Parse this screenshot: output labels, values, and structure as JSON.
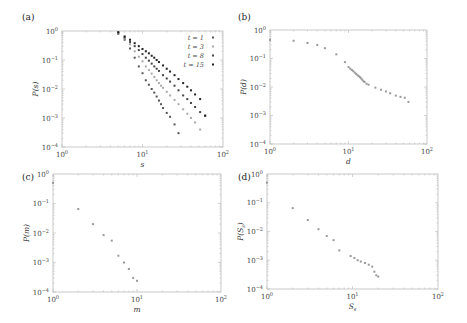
{
  "chart_data": [
    {
      "panel": "(a)",
      "type": "scatter",
      "xlabel": "s",
      "ylabel": "P(s)",
      "xscale": "log",
      "yscale": "log",
      "xlim": [
        1,
        100
      ],
      "ylim": [
        0.0001,
        1
      ],
      "xticks": [
        "10^0",
        "10^1",
        "10^2"
      ],
      "yticks": [
        "10^0",
        "10^-1",
        "10^-2",
        "10^-3",
        "10^-4"
      ],
      "legend_position": "upper right",
      "series": [
        {
          "name": "t = 1",
          "color": "#555",
          "x": [
            5,
            6,
            7,
            8,
            9,
            10,
            11,
            12,
            13,
            14,
            15,
            16,
            17,
            18,
            20,
            22,
            25,
            28
          ],
          "y": [
            0.8,
            0.5,
            0.25,
            0.12,
            0.06,
            0.035,
            0.02,
            0.014,
            0.01,
            0.0075,
            0.0055,
            0.004,
            0.003,
            0.0022,
            0.0015,
            0.0011,
            0.0006,
            0.0003
          ]
        },
        {
          "name": "t = 3",
          "color": "#aaa",
          "x": [
            5,
            6,
            7,
            8,
            9,
            10,
            11,
            12,
            13,
            14,
            15,
            16,
            17,
            18,
            20,
            22,
            25,
            28,
            32,
            36,
            40,
            45,
            52
          ],
          "y": [
            0.85,
            0.55,
            0.35,
            0.2,
            0.13,
            0.09,
            0.06,
            0.045,
            0.034,
            0.026,
            0.02,
            0.016,
            0.013,
            0.011,
            0.008,
            0.006,
            0.0042,
            0.003,
            0.002,
            0.0014,
            0.001,
            0.0007,
            0.0004
          ]
        },
        {
          "name": "t = 8",
          "color": "#444",
          "x": [
            5,
            6,
            7,
            8,
            9,
            10,
            11,
            12,
            13,
            14,
            15,
            16,
            18,
            20,
            22,
            25,
            28,
            32,
            36,
            40,
            45,
            52,
            60
          ],
          "y": [
            0.9,
            0.6,
            0.42,
            0.3,
            0.22,
            0.16,
            0.12,
            0.095,
            0.075,
            0.06,
            0.05,
            0.042,
            0.03,
            0.023,
            0.018,
            0.013,
            0.009,
            0.006,
            0.0045,
            0.0033,
            0.0024,
            0.0016,
            0.0012
          ]
        },
        {
          "name": "t = 15",
          "color": "#222",
          "x": [
            5,
            6,
            7,
            8,
            9,
            10,
            11,
            12,
            13,
            14,
            15,
            16,
            18,
            20,
            22,
            25,
            28,
            32,
            36,
            40,
            45,
            52,
            60
          ],
          "y": [
            0.9,
            0.65,
            0.5,
            0.38,
            0.3,
            0.24,
            0.2,
            0.17,
            0.14,
            0.12,
            0.1,
            0.085,
            0.065,
            0.05,
            0.04,
            0.03,
            0.022,
            0.016,
            0.012,
            0.009,
            0.0065,
            0.0045,
            0.0012
          ]
        }
      ]
    },
    {
      "panel": "(b)",
      "type": "scatter",
      "xlabel": "d",
      "ylabel": "P(d)",
      "xscale": "log",
      "yscale": "log",
      "xlim": [
        1,
        100
      ],
      "ylim": [
        0.0001,
        1
      ],
      "xticks": [
        "10^0",
        "10^1",
        "10^2"
      ],
      "yticks": [
        "10^0",
        "10^-1",
        "10^-2",
        "10^-3",
        "10^-4"
      ],
      "series": [
        {
          "name": "P(d)",
          "color": "#999",
          "x": [
            1,
            2,
            3,
            4,
            5,
            7,
            9,
            10,
            10.5,
            11,
            11.5,
            12,
            12.5,
            13,
            13.5,
            14,
            14.5,
            15,
            15.5,
            16,
            17,
            18,
            22,
            26,
            30,
            34,
            40,
            46,
            52,
            58
          ],
          "y": [
            0.45,
            0.42,
            0.35,
            0.3,
            0.23,
            0.14,
            0.075,
            0.05,
            0.044,
            0.04,
            0.036,
            0.032,
            0.029,
            0.026,
            0.024,
            0.022,
            0.02,
            0.018,
            0.016,
            0.015,
            0.013,
            0.012,
            0.0095,
            0.008,
            0.007,
            0.006,
            0.005,
            0.0045,
            0.0042,
            0.003
          ]
        }
      ]
    },
    {
      "panel": "(c)",
      "type": "scatter",
      "xlabel": "m",
      "ylabel": "P(m)",
      "xscale": "log",
      "yscale": "log",
      "xlim": [
        1,
        100
      ],
      "ylim": [
        0.0001,
        1
      ],
      "xticks": [
        "10^0",
        "10^1",
        "10^2"
      ],
      "yticks": [
        "10^0",
        "10^-1",
        "10^-2",
        "10^-3",
        "10^-4"
      ],
      "series": [
        {
          "name": "P(m)",
          "color": "#999",
          "x": [
            1,
            2,
            3,
            4,
            5,
            6,
            7,
            8,
            9,
            10
          ],
          "y": [
            0.5,
            0.065,
            0.02,
            0.0085,
            0.0055,
            0.0017,
            0.001,
            0.0006,
            0.0003,
            0.00024
          ]
        }
      ]
    },
    {
      "panel": "(d)",
      "type": "scatter",
      "xlabel": "S_s",
      "ylabel": "P(S_s)",
      "xscale": "log",
      "yscale": "log",
      "xlim": [
        1,
        100
      ],
      "ylim": [
        0.0001,
        1
      ],
      "xticks": [
        "10^0",
        "10^1",
        "10^2"
      ],
      "yticks": [
        "10^0",
        "10^-1",
        "10^-2",
        "10^-3",
        "10^-4"
      ],
      "series": [
        {
          "name": "P(S_s)",
          "color": "#999",
          "x": [
            1,
            2,
            3,
            4,
            5,
            6,
            7,
            9.5,
            10.5,
            11.5,
            12.5,
            14,
            15.5,
            17,
            18,
            19,
            20
          ],
          "y": [
            0.5,
            0.065,
            0.025,
            0.012,
            0.007,
            0.005,
            0.0022,
            0.0014,
            0.0012,
            0.001,
            0.0009,
            0.0008,
            0.0007,
            0.0006,
            0.0004,
            0.0003,
            0.00027
          ]
        }
      ]
    }
  ],
  "panels": [
    {
      "label": "(a)",
      "xlabel": "s",
      "ylabel": "P(s)"
    },
    {
      "label": "(b)",
      "xlabel": "d",
      "ylabel": "P(d)"
    },
    {
      "label": "(c)",
      "xlabel": "m",
      "ylabel": "P(m)"
    },
    {
      "label": "(d)",
      "xlabel": "S",
      "xlabel_sub": "s",
      "ylabel": "P(S",
      "ylabel_sub": "s",
      "ylabel_end": ")"
    }
  ],
  "tick_labels": {
    "base": "10",
    "x_exps": [
      "0",
      "1",
      "2"
    ],
    "y_exps": [
      "0",
      "−1",
      "−2",
      "−3",
      "−4"
    ]
  },
  "legend": [
    {
      "label": "t = 1"
    },
    {
      "label": "t = 3"
    },
    {
      "label": "t = 8"
    },
    {
      "label": "t = 15"
    }
  ]
}
